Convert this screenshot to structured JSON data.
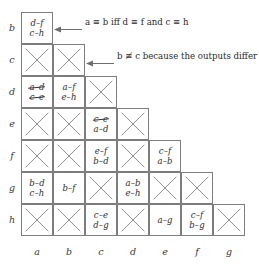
{
  "figure": {
    "row_labels": [
      "b",
      "c",
      "d",
      "e",
      "f",
      "g",
      "h"
    ],
    "col_labels": [
      "a",
      "b",
      "c",
      "d",
      "e",
      "f",
      "g"
    ],
    "annotations": [
      {
        "id": "annotation-equivalence",
        "text": "a ≡ b iff d ≡ f and c ≡ h",
        "target": "cell-b-a"
      },
      {
        "id": "annotation-inequivalence",
        "text": "b ≢ c because the outputs differ",
        "target": "cell-c-b"
      }
    ],
    "rows": [
      {
        "label": "b",
        "cells": [
          {
            "col": "a",
            "type": "pairs",
            "pairs": [
              {
                "text": "d–f",
                "struck": false
              },
              {
                "text": "c–h",
                "struck": false
              }
            ]
          }
        ]
      },
      {
        "label": "c",
        "cells": [
          {
            "col": "a",
            "type": "x",
            "pairs": []
          },
          {
            "col": "b",
            "type": "x",
            "pairs": []
          }
        ]
      },
      {
        "label": "d",
        "cells": [
          {
            "col": "a",
            "type": "pairs",
            "pairs": [
              {
                "text": "a–d",
                "struck": true
              },
              {
                "text": "c–e",
                "struck": true
              }
            ]
          },
          {
            "col": "b",
            "type": "pairs",
            "pairs": [
              {
                "text": "a–f",
                "struck": false
              },
              {
                "text": "e–h",
                "struck": false
              }
            ]
          },
          {
            "col": "c",
            "type": "x",
            "pairs": []
          }
        ]
      },
      {
        "label": "e",
        "cells": [
          {
            "col": "a",
            "type": "x",
            "pairs": []
          },
          {
            "col": "b",
            "type": "x",
            "pairs": []
          },
          {
            "col": "c",
            "type": "pairs",
            "pairs": [
              {
                "text": "c–e",
                "struck": true
              },
              {
                "text": "a–d",
                "struck": false
              }
            ]
          },
          {
            "col": "d",
            "type": "x",
            "pairs": []
          }
        ]
      },
      {
        "label": "f",
        "cells": [
          {
            "col": "a",
            "type": "x",
            "pairs": []
          },
          {
            "col": "b",
            "type": "x",
            "pairs": []
          },
          {
            "col": "c",
            "type": "pairs",
            "pairs": [
              {
                "text": "e–f",
                "struck": false
              },
              {
                "text": "b–d",
                "struck": false
              }
            ]
          },
          {
            "col": "d",
            "type": "x",
            "pairs": []
          },
          {
            "col": "e",
            "type": "pairs",
            "pairs": [
              {
                "text": "c–f",
                "struck": false
              },
              {
                "text": "a–b",
                "struck": false
              }
            ]
          }
        ]
      },
      {
        "label": "g",
        "cells": [
          {
            "col": "a",
            "type": "pairs",
            "pairs": [
              {
                "text": "b–d",
                "struck": false
              },
              {
                "text": "c–h",
                "struck": false
              }
            ]
          },
          {
            "col": "b",
            "type": "pairs",
            "pairs": [
              {
                "text": "b–f",
                "struck": false
              }
            ]
          },
          {
            "col": "c",
            "type": "x",
            "pairs": []
          },
          {
            "col": "d",
            "type": "pairs",
            "pairs": [
              {
                "text": "a–b",
                "struck": false
              },
              {
                "text": "e–h",
                "struck": false
              }
            ]
          },
          {
            "col": "e",
            "type": "x",
            "pairs": []
          },
          {
            "col": "f",
            "type": "x",
            "pairs": []
          }
        ]
      },
      {
        "label": "h",
        "cells": [
          {
            "col": "a",
            "type": "x",
            "pairs": []
          },
          {
            "col": "b",
            "type": "x",
            "pairs": []
          },
          {
            "col": "c",
            "type": "pairs",
            "pairs": [
              {
                "text": "c–e",
                "struck": false
              },
              {
                "text": "d–g",
                "struck": false
              }
            ]
          },
          {
            "col": "d",
            "type": "x",
            "pairs": []
          },
          {
            "col": "e",
            "type": "pairs",
            "pairs": [
              {
                "text": "a–g",
                "struck": false
              }
            ]
          },
          {
            "col": "f",
            "type": "pairs",
            "pairs": [
              {
                "text": "c–f",
                "struck": false
              },
              {
                "text": "b–g",
                "struck": false
              }
            ]
          },
          {
            "col": "g",
            "type": "x",
            "pairs": []
          }
        ]
      }
    ],
    "colors": {
      "border": "#7d7d7d",
      "xmark": "#8a8a8a",
      "text": "#2b2b2b",
      "background": "#ffffff"
    }
  }
}
